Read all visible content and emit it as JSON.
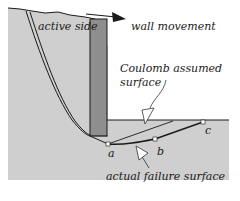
{
  "diagram": {
    "labels": {
      "active_side": "active side",
      "wall_movement": "wall movement",
      "coulomb_line1": "Coulomb assumed",
      "coulomb_line2": "surface",
      "actual_failure": "actual failure surface",
      "point_a": "a",
      "point_b": "b",
      "point_c": "c"
    },
    "colors": {
      "soil": "#cfcfcf",
      "wall": "#8e8e8e",
      "line": "#1a1a1a",
      "background": "#ffffff"
    }
  }
}
